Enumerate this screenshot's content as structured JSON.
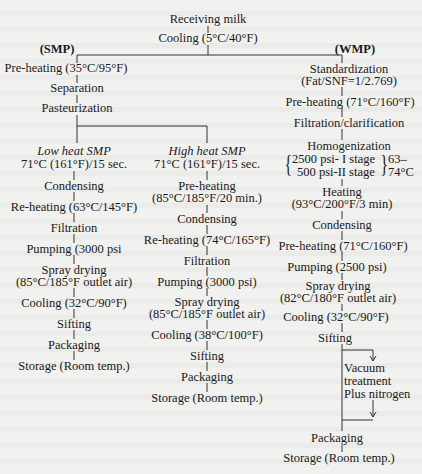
{
  "diagram": {
    "type": "process-flowchart",
    "root": {
      "receiving": "Receiving milk",
      "cooling": "Cooling (5°C/40°F)"
    },
    "branches": {
      "smp": {
        "label": "(SMP)",
        "steps": [
          "Pre-heating (35°C/95°F)",
          "Separation",
          "Pasteurization"
        ],
        "low_heat": {
          "title": "Low heat SMP",
          "subtitle": "71°C (161°F)/15 sec.",
          "steps": [
            "Condensing",
            "Re-heating (63°C/145°F)",
            "Filtration",
            "Pumping (3000 psi",
            "Spray drying",
            "(85°C/185°F outlet air)",
            "Cooling (32°C/90°F)",
            "Sifting",
            "Packaging",
            "Storage (Room temp.)"
          ]
        },
        "high_heat": {
          "title": "High heat SMP",
          "subtitle": "71°C (161°F)/15 sec.",
          "steps": [
            "Pre-heating",
            "(85°C/185°F/20 min.)",
            "Condensing",
            "Re-heating (74°C/165°F)",
            "Filtration",
            "Pumping (3000 psi)",
            "Spray drying",
            "(85°C/185°F outlet air)",
            "Cooling (38°C/100°F)",
            "Sifting",
            "Packaging",
            "Storage (Room temp.)"
          ]
        }
      },
      "wmp": {
        "label": "(WMP)",
        "steps": [
          "Standardization",
          "(Fat/SNF=1/2.769)",
          "Pre-heating (71°C/160°F)",
          "Filtration/clarification",
          "Homogenization",
          "2500 psi- I stage",
          "500 psi-II stage",
          "63–",
          "74°C",
          "Heating",
          "(93°C/200°F/3 min)",
          "Condensing",
          "Pre-heating (71°C/160°F)",
          "Pumping (2500 psi)",
          "Spray drying",
          "(82°C/180°F outlet air)",
          "Cooling (32°C/90°F)",
          "Sifting",
          "Vacuum",
          "treatment",
          "Plus nitrogen",
          "Packaging",
          "Storage (Room temp.)"
        ]
      }
    }
  }
}
